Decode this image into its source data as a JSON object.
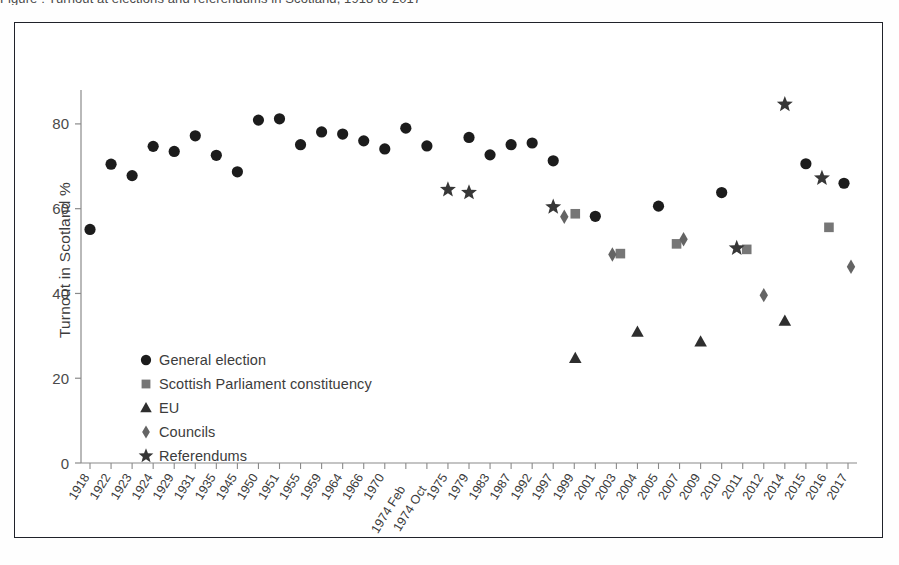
{
  "caption": {
    "clipped_text_above_figure": "Figure : Turnout at elections and referendums in Scotland, 1918 to 2017"
  },
  "chart_data": {
    "type": "scatter",
    "title": "",
    "xlabel": "",
    "ylabel": "Turnout in Scotland %",
    "ylim": [
      0,
      88
    ],
    "yticks": [
      0,
      20,
      40,
      60,
      80
    ],
    "grid": false,
    "legend_position": "inner-left",
    "categories": [
      "1918",
      "1922",
      "1923",
      "1924",
      "1929",
      "1931",
      "1935",
      "1945",
      "1950",
      "1951",
      "1955",
      "1959",
      "1964",
      "1966",
      "1970",
      "1974 Feb",
      "1974 Oct",
      "1975",
      "1979",
      "1983",
      "1987",
      "1992",
      "1997",
      "1999",
      "2001",
      "2003",
      "2004",
      "2005",
      "2007",
      "2009",
      "2010",
      "2011",
      "2012",
      "2014",
      "2015",
      "2016",
      "2017"
    ],
    "series": [
      {
        "name": "General election",
        "marker": "circle",
        "color": "#1c1c1c",
        "points": [
          {
            "x": "1918",
            "y": 55.1
          },
          {
            "x": "1922",
            "y": 70.5
          },
          {
            "x": "1923",
            "y": 67.8
          },
          {
            "x": "1924",
            "y": 74.7
          },
          {
            "x": "1929",
            "y": 73.5
          },
          {
            "x": "1931",
            "y": 77.2
          },
          {
            "x": "1935",
            "y": 72.6
          },
          {
            "x": "1945",
            "y": 68.7
          },
          {
            "x": "1950",
            "y": 80.9
          },
          {
            "x": "1951",
            "y": 81.2
          },
          {
            "x": "1955",
            "y": 75.1
          },
          {
            "x": "1959",
            "y": 78.1
          },
          {
            "x": "1964",
            "y": 77.6
          },
          {
            "x": "1966",
            "y": 76.0
          },
          {
            "x": "1970",
            "y": 74.1
          },
          {
            "x": "1974 Feb",
            "y": 79.0
          },
          {
            "x": "1974 Oct",
            "y": 74.8
          },
          {
            "x": "1979",
            "y": 76.8
          },
          {
            "x": "1983",
            "y": 72.7
          },
          {
            "x": "1987",
            "y": 75.1
          },
          {
            "x": "1992",
            "y": 75.5
          },
          {
            "x": "1997",
            "y": 71.3
          },
          {
            "x": "2001",
            "y": 58.2
          },
          {
            "x": "2005",
            "y": 60.6
          },
          {
            "x": "2010",
            "y": 63.8
          },
          {
            "x": "2015",
            "y": 70.6
          },
          {
            "x": "2017",
            "y": 66.0
          }
        ]
      },
      {
        "name": "Scottish Parliament constituency",
        "marker": "square",
        "color": "#767676",
        "points": [
          {
            "x": "1999",
            "y": 58.8
          },
          {
            "x": "2003",
            "y": 49.4
          },
          {
            "x": "2007",
            "y": 51.7
          },
          {
            "x": "2011",
            "y": 50.4
          },
          {
            "x": "2016",
            "y": 55.6
          }
        ]
      },
      {
        "name": "EU",
        "marker": "triangle",
        "color": "#2e2e2e",
        "points": [
          {
            "x": "1999",
            "y": 24.7
          },
          {
            "x": "2004",
            "y": 30.9
          },
          {
            "x": "2009",
            "y": 28.6
          },
          {
            "x": "2014",
            "y": 33.5
          }
        ]
      },
      {
        "name": "Councils",
        "marker": "diamond",
        "color": "#646464",
        "points": [
          {
            "x": "1999",
            "y": 58.1
          },
          {
            "x": "2003",
            "y": 49.2
          },
          {
            "x": "2007",
            "y": 52.8
          },
          {
            "x": "2012",
            "y": 39.6
          },
          {
            "x": "2017",
            "y": 46.3
          }
        ]
      },
      {
        "name": "Referendums",
        "marker": "star",
        "color": "#373737",
        "points": [
          {
            "x": "1975",
            "y": 64.5
          },
          {
            "x": "1979",
            "y": 63.8
          },
          {
            "x": "1997",
            "y": 60.4
          },
          {
            "x": "2011",
            "y": 50.7
          },
          {
            "x": "2014",
            "y": 84.6
          },
          {
            "x": "2016",
            "y": 67.2
          }
        ]
      }
    ],
    "legend": [
      {
        "label": "General election",
        "marker": "circle",
        "color": "#1c1c1c"
      },
      {
        "label": "Scottish Parliament constituency",
        "marker": "square",
        "color": "#767676"
      },
      {
        "label": "EU",
        "marker": "triangle",
        "color": "#2e2e2e"
      },
      {
        "label": "Councils",
        "marker": "diamond",
        "color": "#646464"
      },
      {
        "label": "Referendums",
        "marker": "star",
        "color": "#373737"
      }
    ]
  }
}
